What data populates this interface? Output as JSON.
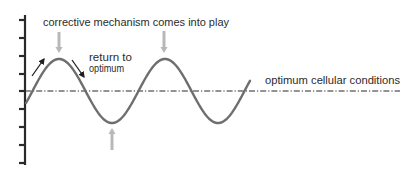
{
  "labels": {
    "corrective": "corrective mechanism comes into play",
    "return_line1": "return to",
    "return_line2": "optimum",
    "optimum": "optimum cellular conditions"
  },
  "colors": {
    "background": "#ffffff",
    "axis": "#2a2a2a",
    "curve": "#6e6e6e",
    "indicator_arrow": "#b8b8b8",
    "direction_arrow": "#1e1e1e",
    "optimum_line": "#2a2a2a",
    "text": "#2b2b2b"
  },
  "axis": {
    "x": 25,
    "y_top": 15,
    "y_bottom": 165,
    "tick_length": 6,
    "ticks_y": [
      20,
      38,
      56,
      74,
      91,
      109,
      127,
      145,
      163
    ]
  },
  "optimum_line": {
    "y": 91,
    "x_start": 25,
    "x_end": 400
  },
  "curve": {
    "type": "sine",
    "x_start": 26,
    "x_end": 250,
    "midline_y": 91,
    "amplitude": 32,
    "period": 106,
    "rising_zero_x": 32.5,
    "peaks_x": [
      59,
      165
    ],
    "troughs_x": [
      112,
      218
    ]
  },
  "indicator_arrows": [
    {
      "name": "down-arrow-peak-1",
      "x": 59,
      "from_y": 32,
      "to_y": 53
    },
    {
      "name": "down-arrow-peak-2",
      "x": 164,
      "from_y": 31,
      "to_y": 53
    },
    {
      "name": "up-arrow-trough-1",
      "x": 112,
      "from_y": 150,
      "to_y": 128
    }
  ],
  "direction_arrows": [
    {
      "name": "rising-arrow",
      "x1": 32,
      "y1": 76,
      "x2": 44,
      "y2": 59
    },
    {
      "name": "falling-arrow",
      "x1": 72,
      "y1": 60,
      "x2": 84,
      "y2": 77
    }
  ]
}
